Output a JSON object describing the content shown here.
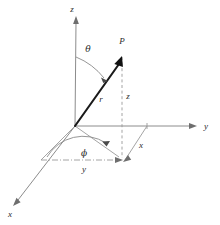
{
  "figure": {
    "kind": "spherical-coordinates-diagram",
    "title": "",
    "background_color": "#ffffff",
    "width": 220,
    "height": 225
  },
  "colors": {
    "vector": "#111111",
    "axis": "#8c8c8c",
    "helper": "#9a9a9a",
    "arc": "#8a8a8a",
    "label": "#2b2b2b"
  },
  "labels": {
    "z_axis": "z",
    "y_axis": "y",
    "x_axis": "x",
    "point": "P",
    "radius": "r",
    "theta": "θ",
    "phi": "ϕ",
    "z_component": "z",
    "y_component": "y",
    "x_component": "x"
  },
  "geometry": {
    "origin": {
      "x": 75,
      "y": 126
    },
    "z_axis_tip": {
      "x": 76,
      "y": 18
    },
    "y_axis_tip": {
      "x": 197,
      "y": 126
    },
    "x_axis_tip": {
      "x": 13,
      "y": 205
    },
    "point_P": {
      "x": 121,
      "y": 57
    },
    "projection_xy": {
      "x": 122,
      "y": 160
    },
    "y_foot": {
      "x": 44,
      "y": 160
    },
    "x_corner": {
      "x": 147,
      "y": 126
    }
  },
  "label_positions": {
    "z_axis": {
      "x": 76,
      "y": 12
    },
    "point": {
      "x": 122,
      "y": 43
    },
    "theta": {
      "x": 88,
      "y": 51
    },
    "radius": {
      "x": 101,
      "y": 101
    },
    "z_component": {
      "x": 127,
      "y": 98
    },
    "y_axis": {
      "x": 205,
      "y": 128
    },
    "x_component": {
      "x": 141,
      "y": 147
    },
    "phi": {
      "x": 84,
      "y": 155
    },
    "y_component": {
      "x": 84,
      "y": 171
    },
    "x_axis": {
      "x": 10,
      "y": 216
    }
  }
}
